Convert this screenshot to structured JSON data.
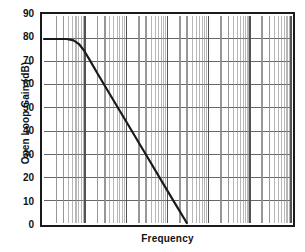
{
  "chart_data": {
    "type": "line",
    "title": "",
    "xlabel": "Frequency",
    "ylabel": "Open Loop Gain (dB)",
    "xscale": "log",
    "yscale": "linear",
    "ylim": [
      0,
      90
    ],
    "yticks": [
      90,
      80,
      70,
      60,
      50,
      40,
      30,
      20,
      10,
      0
    ],
    "ytick_labels": [
      "90",
      "80",
      "70",
      "60",
      "50",
      "40",
      "30",
      "20",
      "10",
      "0"
    ],
    "xlim_decades": [
      0,
      6
    ],
    "xticks": [],
    "xtick_labels": [],
    "grid": true,
    "grid_color": "#8c8c8c",
    "grid_major_color": "#4a4a4a",
    "legend": null,
    "line_color": "#1a1a1a",
    "line_width": 2.2,
    "series": [
      {
        "name": "Open loop gain",
        "points": [
          {
            "x_decade": 0.0,
            "y": 80
          },
          {
            "x_decade": 0.55,
            "y": 80
          },
          {
            "x_decade": 0.72,
            "y": 79.4
          },
          {
            "x_decade": 0.85,
            "y": 77.8
          },
          {
            "x_decade": 0.98,
            "y": 74.8
          },
          {
            "x_decade": 1.12,
            "y": 70.6
          },
          {
            "x_decade": 1.3,
            "y": 65.0
          },
          {
            "x_decade": 1.6,
            "y": 56.0
          },
          {
            "x_decade": 2.0,
            "y": 44.0
          },
          {
            "x_decade": 2.5,
            "y": 29.0
          },
          {
            "x_decade": 3.0,
            "y": 14.0
          },
          {
            "x_decade": 3.2,
            "y": 8.0
          },
          {
            "x_decade": 3.47,
            "y": 0.0
          }
        ],
        "description": "Flat 80 dB plateau then -20 dB/decade rolloff crossing 0 dB"
      }
    ],
    "annotations": []
  },
  "axis": {
    "y_title": "Open Loop Gain (dB)",
    "x_title": "Frequency"
  }
}
